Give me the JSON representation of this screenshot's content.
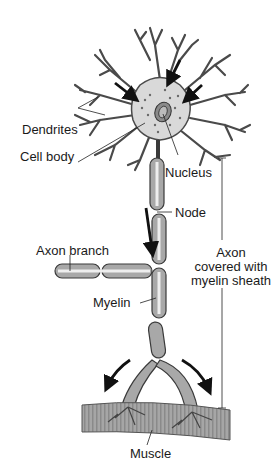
{
  "diagram": {
    "labels": {
      "dendrites": "Dendrites",
      "cell_body": "Cell body",
      "nucleus": "Nucleus",
      "node": "Node",
      "axon_branch": "Axon branch",
      "myelin": "Myelin",
      "axon_sheath_line1": "Axon",
      "axon_sheath_line2": "covered with",
      "axon_sheath_line3": "myelin sheath",
      "muscle": "Muscle"
    },
    "colors": {
      "outline": "#3a3a3a",
      "cell_fill": "#d9d9d9",
      "myelin_fill": "#a8a8a8",
      "muscle_fill": "#9a9a9a",
      "arrow": "#111111",
      "background": "#ffffff"
    }
  }
}
